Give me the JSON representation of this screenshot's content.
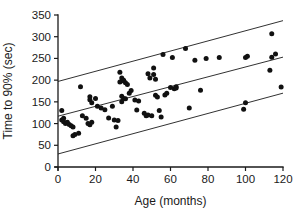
{
  "chart_data": {
    "type": "scatter",
    "title": "",
    "xlabel": "Age (months)",
    "ylabel": "Time to 90% (sec)",
    "xlim": [
      0,
      120
    ],
    "ylim": [
      0,
      350
    ],
    "xticks": [
      0,
      20,
      40,
      60,
      80,
      100,
      120
    ],
    "yticks": [
      0,
      50,
      100,
      150,
      200,
      250,
      300,
      350
    ],
    "grid": false,
    "legend": null,
    "marker": "filled-circle",
    "marker_color": "#111111",
    "line_color": "#1a1a1a",
    "series": [
      {
        "name": "Time to 90% vs Age",
        "points": [
          [
            2,
            130
          ],
          [
            2,
            108
          ],
          [
            3,
            104
          ],
          [
            3,
            112
          ],
          [
            4,
            100
          ],
          [
            5,
            103
          ],
          [
            6,
            98
          ],
          [
            7,
            95
          ],
          [
            8,
            92
          ],
          [
            8,
            72
          ],
          [
            9,
            75
          ],
          [
            11,
            78
          ],
          [
            12,
            185
          ],
          [
            13,
            118
          ],
          [
            15,
            112
          ],
          [
            16,
            100
          ],
          [
            17,
            155
          ],
          [
            17,
            162
          ],
          [
            17,
            97
          ],
          [
            18,
            148
          ],
          [
            18,
            103
          ],
          [
            20,
            158
          ],
          [
            21,
            140
          ],
          [
            23,
            136
          ],
          [
            25,
            132
          ],
          [
            27,
            113
          ],
          [
            29,
            140
          ],
          [
            30,
            108
          ],
          [
            31,
            92
          ],
          [
            32,
            107
          ],
          [
            33,
            218
          ],
          [
            33,
            196
          ],
          [
            34,
            205
          ],
          [
            34,
            150
          ],
          [
            34,
            163
          ],
          [
            35,
            200
          ],
          [
            35,
            158
          ],
          [
            35,
            198
          ],
          [
            36,
            194
          ],
          [
            36,
            157
          ],
          [
            37,
            190
          ],
          [
            38,
            170
          ],
          [
            39,
            176
          ],
          [
            41,
            154
          ],
          [
            42,
            131
          ],
          [
            43,
            152
          ],
          [
            46,
            124
          ],
          [
            47,
            118
          ],
          [
            48,
            215
          ],
          [
            48,
            120
          ],
          [
            49,
            205
          ],
          [
            50,
            118
          ],
          [
            51,
            228
          ],
          [
            51,
            213
          ],
          [
            52,
            202
          ],
          [
            52,
            165
          ],
          [
            53,
            161
          ],
          [
            54,
            130
          ],
          [
            55,
            115
          ],
          [
            56,
            259
          ],
          [
            57,
            166
          ],
          [
            58,
            170
          ],
          [
            60,
            183
          ],
          [
            61,
            252
          ],
          [
            62,
            180
          ],
          [
            63,
            182
          ],
          [
            63,
            185
          ],
          [
            68,
            273
          ],
          [
            70,
            136
          ],
          [
            73,
            246
          ],
          [
            76,
            177
          ],
          [
            79,
            250
          ],
          [
            86,
            252
          ],
          [
            99,
            133
          ],
          [
            100,
            252
          ],
          [
            100,
            148
          ],
          [
            101,
            255
          ],
          [
            113,
            223
          ],
          [
            114,
            307
          ],
          [
            114,
            253
          ],
          [
            116,
            260
          ],
          [
            119,
            184
          ]
        ]
      }
    ],
    "fit_lines": [
      {
        "name": "upper-limit-line",
        "x0": 0,
        "y0": 197,
        "x1": 120,
        "y1": 337
      },
      {
        "name": "regression-line",
        "x0": 0,
        "y0": 117,
        "x1": 120,
        "y1": 253
      },
      {
        "name": "lower-limit-line",
        "x0": 0,
        "y0": 30,
        "x1": 120,
        "y1": 170
      }
    ]
  }
}
